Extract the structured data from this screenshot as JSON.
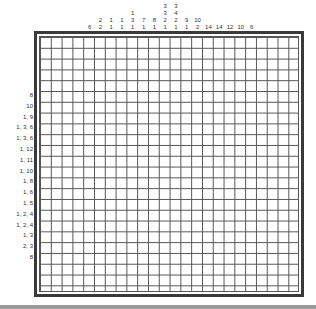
{
  "puzzle": {
    "type": "nonogram",
    "grid_cols": 24,
    "grid_rows": 24,
    "column_clues": [
      [],
      [],
      [],
      [],
      [
        "6"
      ],
      [
        "2",
        "2"
      ],
      [
        "1",
        "1"
      ],
      [
        "1",
        "1"
      ],
      [
        "1",
        "3",
        "1"
      ],
      [
        "7",
        "1"
      ],
      [
        "8",
        "1"
      ],
      [
        "3",
        "3",
        "2",
        "1"
      ],
      [
        "3",
        "4",
        "2",
        "1"
      ],
      [
        "9",
        "1"
      ],
      [
        "10",
        "2"
      ],
      [
        "14"
      ],
      [
        "14"
      ],
      [
        "12"
      ],
      [
        "10"
      ],
      [
        "6"
      ],
      [],
      [],
      [],
      []
    ],
    "row_clues": [
      "",
      "",
      "",
      "",
      "",
      "8",
      "10",
      "1, 9",
      "1, 3, 6",
      "1, 3, 6",
      "1, 12",
      "1, 11",
      "1, 10",
      "1, 8",
      "1, 6",
      "1, 5",
      "1, 2, 4",
      "1, 2, 4",
      "1, 3",
      "2, 3",
      "8",
      "",
      "",
      ""
    ]
  },
  "colors": {
    "grid_line": "#555555",
    "border": "#3a3a3a",
    "bottom_bar": "#9a9a9a",
    "clue_text": "#333333"
  }
}
